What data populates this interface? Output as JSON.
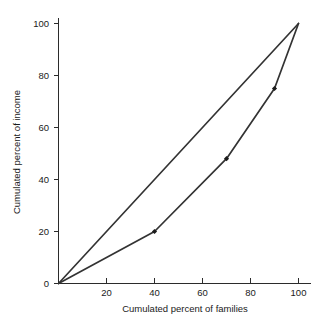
{
  "chart_data": {
    "type": "line",
    "title": "",
    "subtitle": "",
    "xlabel": "Cumulated percent of families",
    "ylabel": "Cumulated percent of income",
    "xlim": [
      0,
      100
    ],
    "ylim": [
      0,
      100
    ],
    "grid": false,
    "legend": "none",
    "x_ticks": [
      0,
      20,
      40,
      60,
      80,
      100
    ],
    "y_ticks": [
      0,
      20,
      40,
      60,
      80,
      100
    ],
    "x_tick_labels": [
      "0",
      "20",
      "40",
      "60",
      "80",
      "100"
    ],
    "y_tick_labels": [
      "0",
      "20",
      "40",
      "60",
      "80",
      "100"
    ],
    "series": [
      {
        "name": "Line of equality",
        "color": "#333333",
        "markers": false,
        "x": [
          0,
          100
        ],
        "y": [
          0,
          100
        ],
        "points": [
          [
            0,
            0
          ],
          [
            100,
            100
          ]
        ]
      },
      {
        "name": "Lorenz curve",
        "color": "#333333",
        "markers": true,
        "x": [
          0,
          40,
          70,
          90,
          100
        ],
        "y": [
          0,
          20,
          48,
          75,
          100
        ],
        "points": [
          [
            0,
            0
          ],
          [
            40,
            20
          ],
          [
            70,
            48
          ],
          [
            90,
            75
          ],
          [
            100,
            100
          ]
        ]
      }
    ],
    "annotations": []
  },
  "axes": {
    "x_label": "Cumulated percent of families",
    "y_label": "Cumulated percent of income",
    "x_tick_labels": [
      "0",
      "20",
      "40",
      "60",
      "80",
      "100"
    ],
    "y_tick_labels": [
      "0",
      "20",
      "40",
      "60",
      "80",
      "100"
    ]
  },
  "colors": {
    "background": "#ffffff",
    "axis": "#2b2b2b",
    "line": "#333333",
    "marker": "#1c1c1c",
    "text": "#1a1a1a"
  }
}
